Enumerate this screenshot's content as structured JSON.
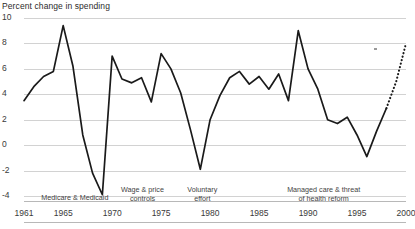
{
  "chart": {
    "title": "Percent change in spending",
    "type": "line",
    "xlabel": "",
    "ylabel": "Percent change in spending"
  },
  "chart_data": {
    "type": "line",
    "title": "Percent change in spending",
    "subtitle": "",
    "xlabel": "",
    "ylabel": "Percent change in spending",
    "xlim": [
      1961,
      2000
    ],
    "ylim": [
      -4,
      10
    ],
    "grid": true,
    "legend": "none",
    "y_ticks": [
      10,
      8,
      6,
      4,
      2,
      0,
      -2,
      -4
    ],
    "x_ticks": [
      1961,
      1965,
      1970,
      1975,
      1980,
      1985,
      1990,
      1995,
      2000
    ],
    "x": [
      1961,
      1962,
      1963,
      1964,
      1965,
      1966,
      1967,
      1968,
      1969,
      1970,
      1971,
      1972,
      1973,
      1974,
      1975,
      1976,
      1977,
      1978,
      1979,
      1980,
      1981,
      1982,
      1983,
      1984,
      1985,
      1986,
      1987,
      1988,
      1989,
      1990,
      1991,
      1992,
      1993,
      1994,
      1995,
      1996,
      1997,
      1998
    ],
    "series": [
      {
        "name": "Actual",
        "style": "solid",
        "values": [
          3.5,
          4.6,
          5.4,
          5.8,
          9.4,
          6.2,
          0.8,
          -2.2,
          -3.9,
          7.0,
          5.2,
          4.9,
          5.3,
          3.4,
          7.2,
          6.0,
          4.1,
          1.2,
          -1.9,
          2.0,
          3.9,
          5.3,
          5.8,
          4.8,
          5.4,
          4.4,
          5.6,
          3.5,
          9.0,
          6.0,
          4.4,
          2.0,
          1.7,
          2.2,
          0.8,
          -0.9,
          1.1,
          2.9
        ]
      },
      {
        "name": "Projected",
        "style": "dotted",
        "x": [
          1998,
          1999,
          2000
        ],
        "values": [
          2.9,
          5.0,
          8.0
        ]
      }
    ],
    "annotations": [
      {
        "text": "Medicare & Medicaid",
        "x_center": 1966.2
      },
      {
        "text": "Wage & price\ncontrols",
        "x_center": 1973.1
      },
      {
        "text": "Voluntary\neffort",
        "x_center": 1979.2
      },
      {
        "text": "Managed care & threat\nof health reform",
        "x_center": 1991.6
      }
    ]
  },
  "colors": {
    "series_line": "#1a1a1a",
    "gridline": "#d2d2d2",
    "axis_rule": "#b8b8b8",
    "text": "#2b2b2b",
    "background": "#ffffff"
  }
}
